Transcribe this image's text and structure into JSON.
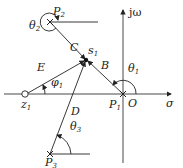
{
  "diagram": {
    "axes": {
      "horizontal_label": "σ",
      "vertical_label": "jω",
      "origin_label": "O"
    },
    "points": {
      "s1": {
        "label": "s",
        "sub": "1"
      },
      "p1": {
        "label": "P",
        "sub": "1"
      },
      "p2": {
        "label": "P",
        "sub": "2"
      },
      "p3": {
        "label": "P",
        "sub": "3"
      },
      "z1": {
        "label": "z",
        "sub": "1"
      }
    },
    "vectors": {
      "B": "B",
      "C": "C",
      "D": "D",
      "E": "E"
    },
    "angles": {
      "theta1": {
        "label": "θ",
        "sub": "1"
      },
      "theta2": {
        "label": "θ",
        "sub": "2"
      },
      "theta3": {
        "label": "θ",
        "sub": "3"
      },
      "phi1": {
        "label": "φ",
        "sub": "1"
      }
    },
    "colors": {
      "line": "#222222",
      "text": "#1a1a1a",
      "background": "#ffffff"
    }
  }
}
